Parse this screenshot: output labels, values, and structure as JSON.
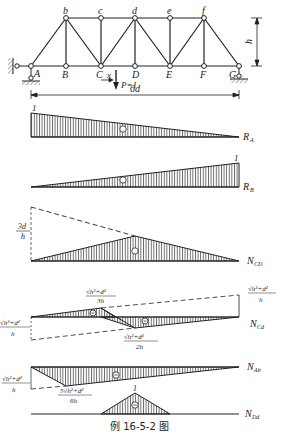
{
  "truss": {
    "top_nodes": [
      "b",
      "c",
      "d",
      "e",
      "f"
    ],
    "bottom_nodes": [
      "A",
      "B",
      "C",
      "D",
      "E",
      "F",
      "G"
    ],
    "height_label": "h",
    "span_label": "6d",
    "load_label": "P=1",
    "position_label": "x"
  },
  "diagrams": [
    {
      "id": "RA",
      "label": "R",
      "sub": "A",
      "value_label": "1",
      "sign": "+"
    },
    {
      "id": "RB",
      "label": "R",
      "sub": "B",
      "value_label": "1",
      "sign": "+"
    },
    {
      "id": "NCD",
      "label": "N",
      "sub": "CD",
      "value_label_num": "3d",
      "value_label_den": "h",
      "sign": "+"
    },
    {
      "id": "NCd",
      "label": "N",
      "sub": "Cd",
      "left_num": "√h²+d²",
      "left_den": "h",
      "right_num": "√h²+d²",
      "right_den": "h",
      "peak1_num": "√h²+d²",
      "peak1_den": "3h",
      "peak2_num": "√h²+d²",
      "peak2_den": "2h",
      "signs": [
        "−",
        "−"
      ]
    },
    {
      "id": "NAb",
      "label": "N",
      "sub": "Ab",
      "left_num": "√h²+d²",
      "left_den": "h",
      "peak_num": "5√h²+d²",
      "peak_den": "6h",
      "sign": "−"
    },
    {
      "id": "NDd",
      "label": "N",
      "sub": "Dd",
      "value_label": "1",
      "sign": "−"
    }
  ],
  "caption": "例 16-5-2 图"
}
